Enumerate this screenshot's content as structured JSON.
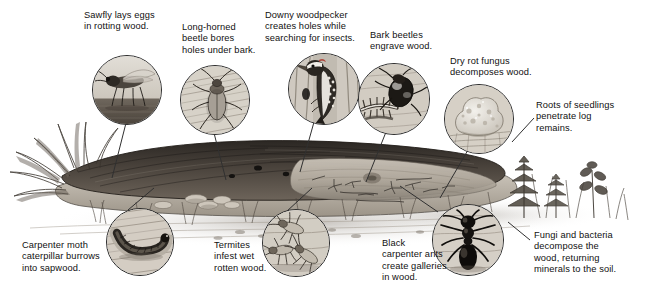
{
  "figure": {
    "type": "illustration",
    "background_color": "#ffffff",
    "ink_color": "#111111"
  },
  "callouts": [
    {
      "id": "sawfly",
      "text": "Sawfly lays eggs\nin rotting wood.",
      "inset_icon": "sawfly-inset",
      "text_x": 84,
      "text_y": 10,
      "text_w": 96,
      "circle_x": 92,
      "circle_y": 55,
      "circle_d": 68,
      "leader": [
        126,
        123,
        112,
        175
      ]
    },
    {
      "id": "long-horned-beetle",
      "text": "Long-horned\nbeetle bores\nholes under bark.",
      "inset_icon": "longhorn-beetle-inset",
      "text_x": 182,
      "text_y": 22,
      "text_w": 92,
      "circle_x": 180,
      "circle_y": 65,
      "circle_d": 68,
      "leader": [
        218,
        133,
        226,
        178
      ]
    },
    {
      "id": "downy-woodpecker",
      "text": "Downy woodpecker\ncreates holes while\nsearching for insects.",
      "inset_icon": "woodpecker-inset",
      "text_x": 265,
      "text_y": 10,
      "text_w": 110,
      "circle_x": 288,
      "circle_y": 53,
      "circle_d": 70,
      "leader": [
        314,
        122,
        298,
        172
      ]
    },
    {
      "id": "bark-beetles",
      "text": "Bark beetles\nengrave wood.",
      "inset_icon": "bark-beetle-inset",
      "text_x": 370,
      "text_y": 30,
      "text_w": 84,
      "circle_x": 358,
      "circle_y": 63,
      "circle_d": 70,
      "leader": [
        386,
        132,
        366,
        180
      ]
    },
    {
      "id": "dry-rot-fungus",
      "text": "Dry rot fungus\ndecomposes wood.",
      "inset_icon": "dry-rot-fungus-inset",
      "text_x": 450,
      "text_y": 56,
      "text_w": 96,
      "circle_x": 444,
      "circle_y": 84,
      "circle_d": 68,
      "leader": [
        470,
        150,
        440,
        196
      ]
    },
    {
      "id": "seedling-roots",
      "text": "Roots of seedlings\npenetrate log\nremains.",
      "inset_icon": "none",
      "text_x": 536,
      "text_y": 100,
      "text_w": 100,
      "leader": [
        534,
        118,
        512,
        140
      ]
    },
    {
      "id": "carpenter-moth",
      "text": "Carpenter moth\ncaterpillar burrows\ninto sapwood.",
      "inset_icon": "caterpillar-inset",
      "text_x": 22,
      "text_y": 240,
      "text_w": 100,
      "circle_x": 106,
      "circle_y": 208,
      "circle_d": 66,
      "leader": [
        126,
        210,
        152,
        186
      ]
    },
    {
      "id": "termites",
      "text": "Termites\ninfest wet\nrotten wood.",
      "inset_icon": "termites-inset",
      "text_x": 214,
      "text_y": 240,
      "text_w": 74,
      "circle_x": 262,
      "circle_y": 209,
      "circle_d": 66,
      "leader": [
        286,
        210,
        312,
        186
      ]
    },
    {
      "id": "black-carpenter-ants",
      "text": "Black\ncarpenter ants\ncreate galleries\nin wood.",
      "inset_icon": "ant-inset",
      "text_x": 382,
      "text_y": 238,
      "text_w": 84,
      "circle_x": 432,
      "circle_y": 204,
      "circle_d": 70,
      "leader": [
        440,
        212,
        402,
        184
      ]
    },
    {
      "id": "fungi-and-bacteria",
      "text": "Fungi and bacteria\ndecompose the\nwood, returning\nminerals to the soil.",
      "inset_icon": "none",
      "text_x": 534,
      "text_y": 230,
      "text_w": 112,
      "leader": [
        532,
        238,
        512,
        220
      ]
    }
  ],
  "scene": {
    "log_label": "fallen-decaying-log",
    "ground_label": "forest-floor",
    "plants": [
      "conifer-seedling",
      "grasses",
      "broadleaf-seedling"
    ]
  }
}
